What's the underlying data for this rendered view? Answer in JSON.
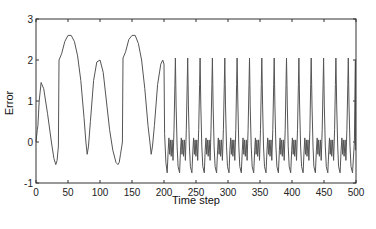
{
  "chart_data": {
    "type": "line",
    "title": "",
    "xlabel": "Time step",
    "ylabel": "Error",
    "xlim": [
      0,
      500
    ],
    "ylim": [
      -1,
      3
    ],
    "xticks": [
      0,
      50,
      100,
      150,
      200,
      250,
      300,
      350,
      400,
      450,
      500
    ],
    "yticks": [
      -1,
      0,
      1,
      2,
      3
    ],
    "grid": false,
    "legend": null,
    "line_color": "#555555",
    "series": [
      {
        "name": "Error",
        "description": "Large slow oscillations (peaks ~1.45, 2.6, 2.0, 2.6, 2.0) for t<200; then periodic spikes to ~2.05 every ~19.3 steps with small oscillations between -0.75 and 0.1",
        "x": [
          0,
          2,
          3,
          5,
          8,
          12,
          18,
          24,
          28,
          31,
          33,
          35,
          36,
          40,
          45,
          50,
          55,
          60,
          65,
          70,
          75,
          78,
          80,
          82,
          85,
          90,
          95,
          100,
          105,
          110,
          115,
          120,
          125,
          128,
          130,
          132,
          134,
          135,
          136,
          140,
          145,
          150,
          155,
          160,
          165,
          170,
          175,
          178,
          180,
          182,
          185,
          190,
          195,
          198,
          200,
          201,
          203,
          205
        ],
        "y": [
          0,
          0.3,
          0.4,
          1.0,
          1.45,
          1.3,
          0.7,
          0.0,
          -0.4,
          -0.55,
          -0.45,
          -0.1,
          2.0,
          2.15,
          2.45,
          2.6,
          2.6,
          2.45,
          2.1,
          1.5,
          0.6,
          0.0,
          -0.3,
          -0.1,
          0.5,
          1.5,
          1.95,
          2.0,
          1.7,
          1.0,
          0.3,
          -0.2,
          -0.5,
          -0.55,
          -0.5,
          -0.3,
          -0.1,
          0.0,
          2.05,
          2.2,
          2.5,
          2.6,
          2.6,
          2.4,
          2.0,
          1.3,
          0.4,
          0.0,
          -0.3,
          -0.1,
          0.4,
          1.4,
          1.9,
          2.0,
          1.9,
          0.2,
          -0.5,
          -0.75
        ]
      }
    ],
    "periodic_segment": {
      "start": 210,
      "end": 498,
      "period": 19.3,
      "spike_peak": 2.05,
      "trough": -0.75,
      "small_osc_high": 0.1,
      "small_osc_low": -0.35
    }
  }
}
